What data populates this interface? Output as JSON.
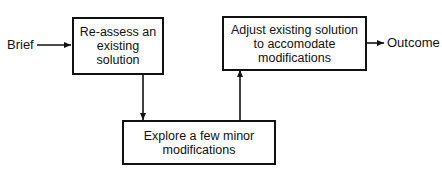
{
  "diagram": {
    "input_label": "Brief",
    "output_label": "Outcome",
    "nodes": [
      {
        "id": "reassess",
        "text": "Re-assess an existing solution"
      },
      {
        "id": "explore",
        "text": "Explore a few minor modifications"
      },
      {
        "id": "adjust",
        "text": "Adjust existing solution to accomodate modifications"
      }
    ],
    "edges": [
      {
        "from": "Brief",
        "to": "reassess"
      },
      {
        "from": "reassess",
        "to": "explore"
      },
      {
        "from": "explore",
        "to": "adjust"
      },
      {
        "from": "adjust",
        "to": "Outcome"
      }
    ],
    "colors": {
      "line": "#111111",
      "background": "#ffffff"
    }
  }
}
